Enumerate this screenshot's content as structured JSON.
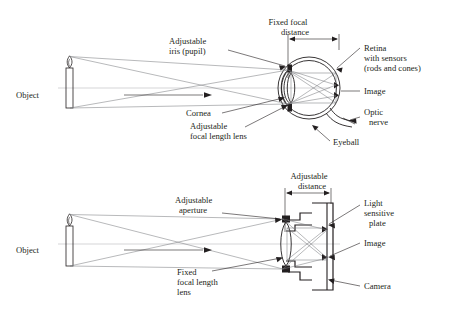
{
  "figure": {
    "type": "optics-comparison-diagram",
    "background_color": "#ffffff",
    "ink_color": "#231f20",
    "ray_color": "#7d7f82",
    "axis_color": "#b9bbbd"
  },
  "eye_diagram": {
    "name": "human-eye-optics",
    "object_label": "Object",
    "dimension_label_line1": "Fixed focal",
    "dimension_label_line2": "distance",
    "labels": {
      "iris_line1": "Adjustable",
      "iris_line2": "iris (pupil)",
      "cornea": "Cornea",
      "lens_line1": "Adjustable",
      "lens_line2": "focal length lens",
      "retina_line1": "Retina",
      "retina_line2": "with sensors",
      "retina_line3": "(rods and cones)",
      "image": "Image",
      "optic_line1": "Optic",
      "optic_line2": "nerve",
      "eyeball": "Eyeball"
    }
  },
  "camera_diagram": {
    "name": "camera-optics",
    "object_label": "Object",
    "dimension_label_line1": "Adjustable",
    "dimension_label_line2": "distance",
    "labels": {
      "aperture_line1": "Adjustable",
      "aperture_line2": "aperture",
      "lens_line1": "Fixed",
      "lens_line2": "focal length",
      "lens_line3": "lens",
      "plate_line1": "Light",
      "plate_line2": "sensitive",
      "plate_line3": "plate",
      "image": "Image",
      "camera": "Camera"
    }
  }
}
